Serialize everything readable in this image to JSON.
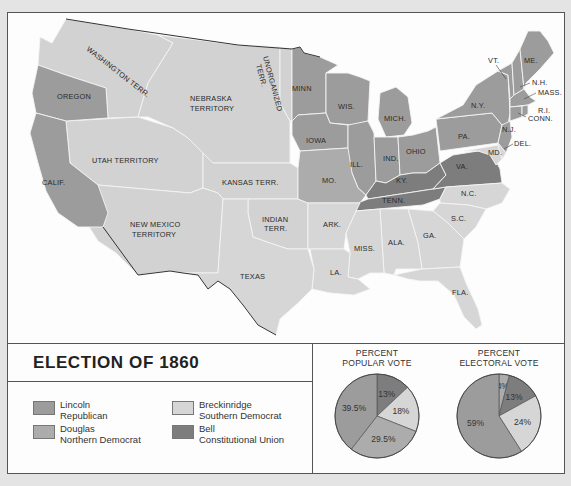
{
  "title": "ELECTION OF 1860",
  "colors": {
    "lincoln": "#9c9c9c",
    "douglas": "#acacac",
    "breckinridge": "#d6d6d6",
    "bell": "#7d7d7d",
    "territory": "#d2d2d2",
    "background": "#fdfdfd"
  },
  "legend": [
    {
      "key": "lincoln",
      "line1": "Lincoln",
      "line2": "Republican"
    },
    {
      "key": "breckinridge",
      "line1": "Breckinridge",
      "line2": "Southern Democrat"
    },
    {
      "key": "douglas",
      "line1": "Douglas",
      "line2": "Northern Democrat"
    },
    {
      "key": "bell",
      "line1": "Bell",
      "line2": "Constitutional Union"
    }
  ],
  "map_labels": {
    "washington": "WASHINGTON TERR.",
    "oregon": "OREGON",
    "nebraska1": "NEBRASKA",
    "nebraska2": "TERRITORY",
    "unorganized1": "UNORGANIZED",
    "unorganized2": "TERR.",
    "minn": "MINN",
    "wis": "WIS.",
    "mich": "MICH.",
    "iowa": "IOWA",
    "ill": "ILL.",
    "ind": "IND.",
    "ohio": "OHIO",
    "ny": "N.Y.",
    "pa": "PA.",
    "vt": "VT.",
    "me": "ME.",
    "nh": "N.H.",
    "mass": "MASS.",
    "ri": "R.I.",
    "conn": "CONN.",
    "nj": "N.J.",
    "del": "DEL.",
    "md": "MD.",
    "va": "VA.",
    "ky": "KY.",
    "tenn": "TENN.",
    "nc": "N.C.",
    "sc": "S.C.",
    "ga": "GA.",
    "ala": "ALA.",
    "miss": "MISS.",
    "la": "LA.",
    "ark": "ARK.",
    "fla": "FLA.",
    "mo": "MO.",
    "texas": "TEXAS",
    "indian1": "INDIAN",
    "indian2": "TERR.",
    "kansas": "KANSAS TERR.",
    "utah": "UTAH TERRITORY",
    "calif": "CALIF.",
    "nm1": "NEW MEXICO",
    "nm2": "TERRITORY"
  },
  "state_winners": {
    "oregon": "lincoln",
    "california": "lincoln",
    "minnesota": "lincoln",
    "wisconsin": "lincoln",
    "michigan": "lincoln",
    "iowa": "lincoln",
    "illinois": "lincoln",
    "indiana": "lincoln",
    "ohio": "lincoln",
    "new_york": "lincoln",
    "pennsylvania": "lincoln",
    "new_jersey": "lincoln",
    "vermont": "lincoln",
    "maine": "lincoln",
    "new_hampshire": "lincoln",
    "massachusetts": "lincoln",
    "rhode_island": "lincoln",
    "connecticut": "lincoln",
    "missouri": "douglas",
    "virginia": "bell",
    "kentucky": "bell",
    "tennessee": "bell",
    "maryland": "breckinridge",
    "delaware": "breckinridge",
    "north_carolina": "breckinridge",
    "south_carolina": "breckinridge",
    "georgia": "breckinridge",
    "alabama": "breckinridge",
    "mississippi": "breckinridge",
    "louisiana": "breckinridge",
    "arkansas": "breckinridge",
    "texas": "breckinridge",
    "florida": "breckinridge"
  },
  "chart_data": [
    {
      "type": "pie",
      "title": "PERCENT POPULAR VOTE",
      "title_line1": "PERCENT",
      "title_line2": "POPULAR VOTE",
      "slices": [
        {
          "name": "Bell",
          "key": "bell",
          "value": 13,
          "label": "13%"
        },
        {
          "name": "Breckinridge",
          "key": "breckinridge",
          "value": 18,
          "label": "18%"
        },
        {
          "name": "Douglas",
          "key": "douglas",
          "value": 29.5,
          "label": "29.5%"
        },
        {
          "name": "Lincoln",
          "key": "lincoln",
          "value": 39.5,
          "label": "39.5%"
        }
      ]
    },
    {
      "type": "pie",
      "title": "PERCENT ELECTORAL VOTE",
      "title_line1": "PERCENT",
      "title_line2": "ELECTORAL VOTE",
      "slices": [
        {
          "name": "Douglas",
          "key": "douglas",
          "value": 4,
          "label": "4%"
        },
        {
          "name": "Bell",
          "key": "bell",
          "value": 13,
          "label": "13%"
        },
        {
          "name": "Breckinridge",
          "key": "breckinridge",
          "value": 24,
          "label": "24%"
        },
        {
          "name": "Lincoln",
          "key": "lincoln",
          "value": 59,
          "label": "59%"
        }
      ]
    }
  ]
}
